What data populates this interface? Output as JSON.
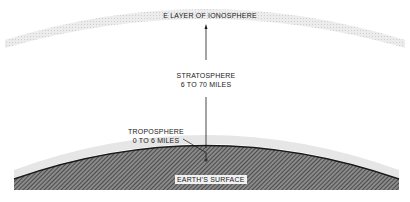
{
  "diagram": {
    "labels": {
      "ionosphere": "E LAYER OF IONOSPHERE",
      "stratosphere_name": "STRATOSPHERE",
      "stratosphere_range": "6 TO 70 MILES",
      "troposphere_name": "TROPOSPHERE",
      "troposphere_range": "0 TO 6 MILES",
      "surface": "EARTH'S SURFACE"
    },
    "colors": {
      "ionosphere_band": "#dcdcdc",
      "troposphere_band": "#e2e2e2",
      "earth_hatch_dark": "#4a4a4a",
      "earth_hatch_light": "#ffffff",
      "line": "#1a1a1a"
    }
  }
}
